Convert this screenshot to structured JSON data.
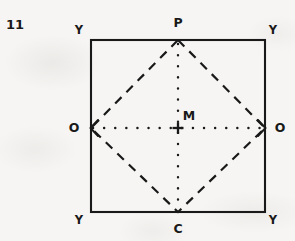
{
  "figure": {
    "index_label": "11",
    "background_color": "#f6f5f3",
    "ink_color": "#191919",
    "square": {
      "name": "outer-square",
      "stroke_style": "solid",
      "left": 91,
      "top": 40,
      "right": 265,
      "bottom": 212
    },
    "diamond": {
      "name": "inscribed-diamond",
      "stroke_style": "dashed",
      "vertices": [
        {
          "label": "P",
          "x": 178,
          "y": 40
        },
        {
          "label": "O",
          "x": 265,
          "y": 128
        },
        {
          "label": "C",
          "x": 178,
          "y": 212
        },
        {
          "label": "O",
          "x": 91,
          "y": 128
        }
      ]
    },
    "axes": {
      "horizontal": {
        "name": "horizontal-axis",
        "stroke_style": "dotted",
        "arrow_start": true,
        "arrow_end": true,
        "x1": 91,
        "y1": 128,
        "x2": 265,
        "y2": 128
      },
      "vertical": {
        "name": "vertical-axis",
        "stroke_style": "dotted",
        "arrow_start": false,
        "arrow_end": false,
        "x1": 178,
        "y1": 40,
        "x2": 178,
        "y2": 212
      }
    },
    "center": {
      "label": "M",
      "marker": "plus",
      "x": 178,
      "y": 128
    },
    "labels": [
      {
        "name": "label-index",
        "text": "11",
        "x": 15,
        "y": 24,
        "kind": "index"
      },
      {
        "name": "label-corner-top-left",
        "text": "Y",
        "x": 79,
        "y": 31,
        "kind": "corner"
      },
      {
        "name": "label-corner-top-right",
        "text": "Y",
        "x": 273,
        "y": 31,
        "kind": "corner"
      },
      {
        "name": "label-corner-bottom-left",
        "text": "Y",
        "x": 79,
        "y": 221,
        "kind": "corner"
      },
      {
        "name": "label-corner-bottom-right",
        "text": "Y",
        "x": 273,
        "y": 221,
        "kind": "corner"
      },
      {
        "name": "label-vertex-p",
        "text": "P",
        "x": 178,
        "y": 23,
        "kind": "vertex"
      },
      {
        "name": "label-vertex-c",
        "text": "C",
        "x": 178,
        "y": 229,
        "kind": "vertex"
      },
      {
        "name": "label-vertex-o-left",
        "text": "O",
        "x": 74,
        "y": 128,
        "kind": "vertex"
      },
      {
        "name": "label-vertex-o-right",
        "text": "O",
        "x": 280,
        "y": 128,
        "kind": "vertex"
      },
      {
        "name": "label-center-m",
        "text": "M",
        "x": 189,
        "y": 116,
        "kind": "vertex"
      }
    ]
  }
}
